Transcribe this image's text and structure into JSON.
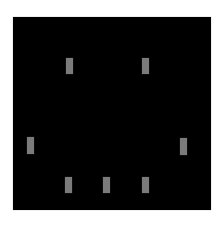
{
  "canvas": {
    "x": 13,
    "y": 17,
    "width": 198,
    "height": 193,
    "color": "#000000"
  },
  "bar_color": "#7b7b7b",
  "bars": [
    {
      "x": 66,
      "y": 58,
      "width": 7,
      "height": 16
    },
    {
      "x": 142,
      "y": 58,
      "width": 7,
      "height": 16
    },
    {
      "x": 27,
      "y": 137,
      "width": 7,
      "height": 17
    },
    {
      "x": 180,
      "y": 138,
      "width": 7,
      "height": 17
    },
    {
      "x": 65,
      "y": 177,
      "width": 7,
      "height": 16
    },
    {
      "x": 103,
      "y": 177,
      "width": 7,
      "height": 16
    },
    {
      "x": 142,
      "y": 177,
      "width": 7,
      "height": 16
    }
  ]
}
